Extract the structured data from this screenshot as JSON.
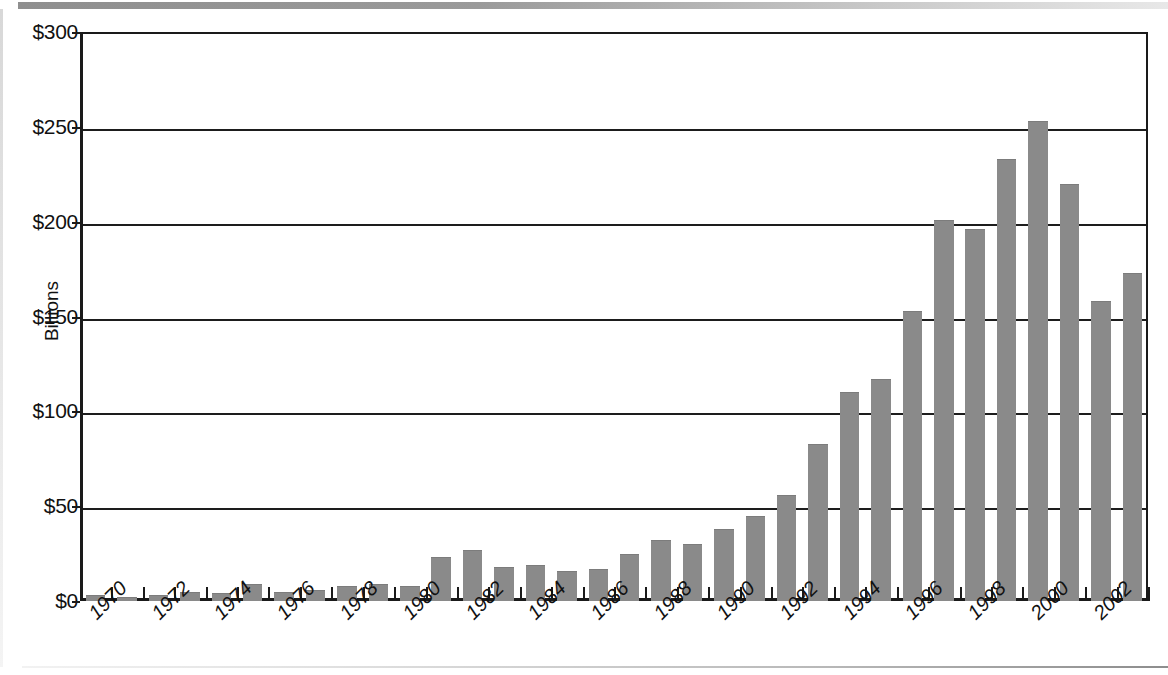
{
  "chart_data": {
    "type": "bar",
    "title": "",
    "subtitle": "",
    "xlabel": "",
    "ylabel": "Billions",
    "ylim": [
      0,
      300
    ],
    "ytick_values": [
      0,
      50,
      100,
      150,
      200,
      250,
      300
    ],
    "ytick_labels": [
      "$0",
      "$50",
      "$100",
      "$150",
      "$200",
      "$250",
      "$300"
    ],
    "grid": true,
    "legend": "none",
    "bar_color": "#8a8a8a",
    "axis_color": "#1a1a1a",
    "xtick_label_rotation": -45,
    "xtick_label_interval": 2,
    "xtick_labels": [
      "1970",
      "1972",
      "1974",
      "1976",
      "1978",
      "1980",
      "1982",
      "1984",
      "1986",
      "1988",
      "1990",
      "1992",
      "1994",
      "1996",
      "1998",
      "2000",
      "2002"
    ],
    "categories": [
      "1970",
      "1971",
      "1972",
      "1973",
      "1974",
      "1975",
      "1976",
      "1977",
      "1978",
      "1979",
      "1980",
      "1981",
      "1982",
      "1983",
      "1984",
      "1985",
      "1986",
      "1987",
      "1988",
      "1989",
      "1990",
      "1991",
      "1992",
      "1993",
      "1994",
      "1995",
      "1996",
      "1997",
      "1998",
      "1999",
      "2000",
      "2001",
      "2002",
      "2003"
    ],
    "values": [
      3,
      2,
      3,
      5,
      4,
      9,
      5,
      6,
      8,
      9,
      8,
      23,
      27,
      18,
      19,
      16,
      17,
      25,
      32,
      30,
      38,
      45,
      56,
      83,
      110,
      117,
      153,
      201,
      196,
      233,
      253,
      220,
      158,
      173
    ],
    "units": "Billions of dollars"
  },
  "figure": {
    "y_axis_title": "Billions"
  }
}
